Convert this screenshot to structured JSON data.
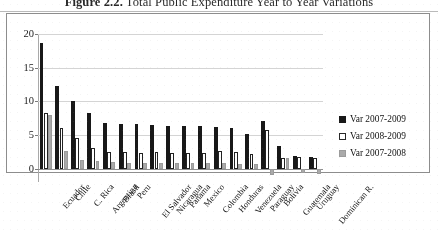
{
  "figure": {
    "caption_label": "Figure 2.2.",
    "caption_text": "Total Public Expenditure Year to Year Variations"
  },
  "legend": {
    "position": "right",
    "entries": [
      {
        "label": "Var 2007-2009",
        "color": "#1a1a1a",
        "style": "filled-black"
      },
      {
        "label": "Var 2008-2009",
        "color": "#ffffff",
        "style": "outlined-white"
      },
      {
        "label": "Var 2007-2008",
        "color": "#a9a9a9",
        "style": "filled-gray"
      }
    ]
  },
  "axes": {
    "y_ticks": [
      "0",
      "5",
      "10",
      "15",
      "20"
    ],
    "y_min": -2,
    "y_max": 20,
    "grid": true,
    "xlabel": "",
    "ylabel": ""
  },
  "chart_data": {
    "type": "bar",
    "title": "Total Public Expenditure Year to Year Variations",
    "xlabel": "",
    "ylabel": "",
    "ylim": [
      -2,
      20
    ],
    "grid": true,
    "legend_position": "right",
    "categories": [
      "Ecuador",
      "Chile",
      "C. Rica",
      "Argentina",
      "Brasil",
      "Peru",
      "El Salvador",
      "Nicaragua",
      "Panama",
      "Mexico",
      "Colombia",
      "Honduras",
      "Venezuela",
      "Paraguay",
      "Bolivia",
      "Guatemala",
      "Uruguay",
      "Dominican R."
    ],
    "series": [
      {
        "name": "Var 2007-2009",
        "color": "#1a1a1a",
        "values": [
          18.7,
          12.2,
          10.0,
          8.2,
          6.7,
          6.6,
          6.6,
          6.5,
          6.3,
          6.3,
          6.3,
          6.2,
          6.1,
          5.2,
          7.0,
          3.3,
          1.9,
          1.7
        ]
      },
      {
        "name": "Var 2008-2009",
        "color": "#ffffff",
        "values": [
          8.2,
          6.1,
          4.6,
          3.0,
          2.4,
          2.5,
          2.3,
          2.4,
          2.3,
          2.3,
          2.3,
          2.6,
          2.5,
          2.2,
          5.7,
          1.5,
          1.7,
          1.5
        ]
      },
      {
        "name": "Var 2007-2008",
        "color": "#a9a9a9",
        "values": [
          7.9,
          2.6,
          1.3,
          1.1,
          0.9,
          0.8,
          0.8,
          0.8,
          0.8,
          0.8,
          0.8,
          0.8,
          0.7,
          0.7,
          -1.0,
          1.5,
          -0.6,
          -0.8
        ]
      }
    ]
  }
}
